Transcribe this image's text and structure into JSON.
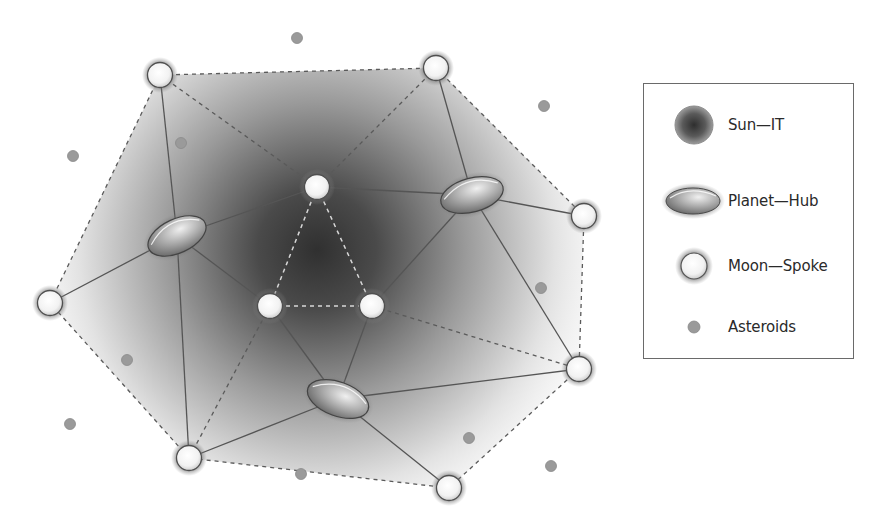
{
  "diagram": {
    "sun": {
      "label": "Sun—IT",
      "cx": 317,
      "cy": 250
    },
    "planets": [
      {
        "id": "planet-left",
        "cx": 177,
        "cy": 236,
        "rx": 31,
        "ry": 17,
        "rotate": -25
      },
      {
        "id": "planet-right",
        "cx": 472,
        "cy": 195,
        "rx": 32,
        "ry": 17,
        "rotate": -15
      },
      {
        "id": "planet-bottom",
        "cx": 338,
        "cy": 399,
        "rx": 32,
        "ry": 17,
        "rotate": 20
      }
    ],
    "moons": [
      {
        "id": "moon-top-left",
        "cx": 160,
        "cy": 75
      },
      {
        "id": "moon-top-right",
        "cx": 436,
        "cy": 68
      },
      {
        "id": "moon-right",
        "cx": 584,
        "cy": 216
      },
      {
        "id": "moon-lower-right",
        "cx": 579,
        "cy": 369
      },
      {
        "id": "moon-bottom-right",
        "cx": 449,
        "cy": 488
      },
      {
        "id": "moon-bottom-left",
        "cx": 189,
        "cy": 458
      },
      {
        "id": "moon-left",
        "cx": 50,
        "cy": 303
      },
      {
        "id": "moon-inner-top",
        "cx": 317,
        "cy": 187
      },
      {
        "id": "moon-inner-left",
        "cx": 270,
        "cy": 306
      },
      {
        "id": "moon-inner-right",
        "cx": 372,
        "cy": 306
      }
    ],
    "asteroids": [
      {
        "cx": 297,
        "cy": 38
      },
      {
        "cx": 544,
        "cy": 106
      },
      {
        "cx": 73,
        "cy": 156
      },
      {
        "cx": 181,
        "cy": 143
      },
      {
        "cx": 541,
        "cy": 288
      },
      {
        "cx": 127,
        "cy": 360
      },
      {
        "cx": 70,
        "cy": 424
      },
      {
        "cx": 301,
        "cy": 474
      },
      {
        "cx": 469,
        "cy": 438
      },
      {
        "cx": 551,
        "cy": 466
      }
    ],
    "solid_links": [
      [
        "planet-left",
        "moon-top-left"
      ],
      [
        "planet-left",
        "moon-left"
      ],
      [
        "planet-left",
        "moon-bottom-left"
      ],
      [
        "planet-left",
        "moon-inner-top"
      ],
      [
        "planet-left",
        "moon-inner-left"
      ],
      [
        "planet-right",
        "moon-top-right"
      ],
      [
        "planet-right",
        "moon-right"
      ],
      [
        "planet-right",
        "moon-lower-right"
      ],
      [
        "planet-right",
        "moon-inner-top"
      ],
      [
        "planet-right",
        "moon-inner-right"
      ],
      [
        "planet-bottom",
        "moon-inner-left"
      ],
      [
        "planet-bottom",
        "moon-inner-right"
      ],
      [
        "planet-bottom",
        "moon-bottom-left"
      ],
      [
        "planet-bottom",
        "moon-bottom-right"
      ],
      [
        "planet-bottom",
        "moon-lower-right"
      ]
    ],
    "dashed_links": [
      [
        "moon-top-left",
        "moon-top-right"
      ],
      [
        "moon-top-right",
        "moon-right"
      ],
      [
        "moon-right",
        "moon-lower-right"
      ],
      [
        "moon-lower-right",
        "moon-bottom-right"
      ],
      [
        "moon-bottom-right",
        "moon-bottom-left"
      ],
      [
        "moon-bottom-left",
        "moon-left"
      ],
      [
        "moon-left",
        "moon-top-left"
      ],
      [
        "moon-top-left",
        "moon-inner-top"
      ],
      [
        "moon-top-right",
        "moon-inner-top"
      ],
      [
        "moon-inner-right",
        "moon-lower-right"
      ],
      [
        "moon-inner-left",
        "moon-bottom-left"
      ]
    ],
    "inner_dashed_links": [
      [
        "moon-inner-top",
        "moon-inner-left"
      ],
      [
        "moon-inner-top",
        "moon-inner-right"
      ],
      [
        "moon-inner-left",
        "moon-inner-right"
      ]
    ]
  },
  "legend": {
    "items": [
      {
        "icon": "sun-icon",
        "label": "Sun—IT"
      },
      {
        "icon": "planet-icon",
        "label": "Planet—Hub"
      },
      {
        "icon": "moon-icon",
        "label": "Moon—Spoke"
      },
      {
        "icon": "asteroid-icon",
        "label": "Asteroids"
      }
    ]
  },
  "colors": {
    "sun_core": "#3a3a3a",
    "link": "#555555",
    "dash": "#5a5a5a",
    "inner_dash": "#d8d8d8",
    "asteroid": "#9a9a9a",
    "moon_fill": "#f7f7f7",
    "legend_border": "#6a6a6a"
  }
}
